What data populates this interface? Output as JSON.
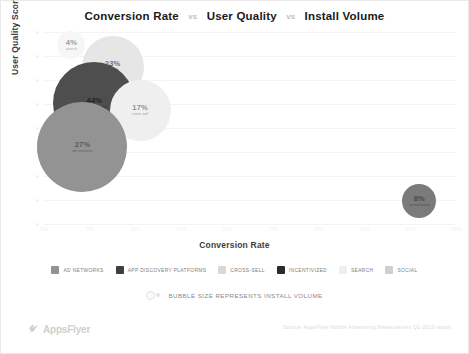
{
  "chart_data": {
    "type": "scatter",
    "title_parts": [
      "Conversion Rate",
      "User Quality",
      "Install Volume"
    ],
    "title_separator": "vs",
    "xlabel": "Conversion Rate",
    "ylabel": "User Quality Score",
    "xlim": [
      0,
      45
    ],
    "ylim": [
      0,
      100
    ],
    "xticks": [
      "0%",
      "5%",
      "10%",
      "15%",
      "20%",
      "25%",
      "30%",
      "35%",
      "40%",
      "45%"
    ],
    "grid": true,
    "legend_position": "bottom",
    "size_note": "BUBBLE SIZE REPRESENTS INSTALL VOLUME",
    "points": [
      {
        "label": "4%",
        "name": "search",
        "x": 3.0,
        "y": 93.0,
        "size": 28,
        "color": "#f6f6f6",
        "text_color": "#9a9a9a",
        "category": "SEARCH"
      },
      {
        "label": "23%",
        "name": "social",
        "x": 7.5,
        "y": 82.0,
        "size": 62,
        "color": "#e6e6e6",
        "text_color": "#6e6e6e",
        "category": "SOCIAL"
      },
      {
        "label": "44%",
        "name": "app discovery",
        "x": 5.5,
        "y": 63.0,
        "size": 82,
        "color": "#4e4e4e",
        "text_color": "#1f1f1f",
        "category": "APP DISCOVERY PLATFORMS"
      },
      {
        "label": "17%",
        "name": "cross-sell",
        "x": 10.5,
        "y": 59.0,
        "size": 61,
        "color": "#efefef",
        "text_color": "#8f8f8f",
        "category": "CROSS-SELL"
      },
      {
        "label": "27%",
        "name": "ad networks",
        "x": 4.2,
        "y": 40.0,
        "size": 90,
        "color": "#939393",
        "text_color": "#5a5a5a",
        "category": "AD NETWORKS"
      },
      {
        "label": "8%",
        "name": "incentivized",
        "x": 41.0,
        "y": 12.0,
        "size": 34,
        "color": "#7b7b7b",
        "text_color": "#4a4a4a",
        "category": "INCENTIVIZED"
      }
    ],
    "legend": [
      {
        "label": "AD NETWORKS",
        "color": "#939393"
      },
      {
        "label": "APP DISCOVERY PLATFORMS",
        "color": "#3f3f3f"
      },
      {
        "label": "CROSS-SELL",
        "color": "#d8d8d8"
      },
      {
        "label": "INCENTIVIZED",
        "color": "#2b2b2b"
      },
      {
        "label": "SEARCH",
        "color": "#efefef"
      },
      {
        "label": "SOCIAL",
        "color": "#cfcfcf"
      }
    ]
  },
  "footer": {
    "brand": "AppsFlyer",
    "source": "Source: AppsFlyer Mobile Advertising Measurement Q1-2013 report"
  }
}
